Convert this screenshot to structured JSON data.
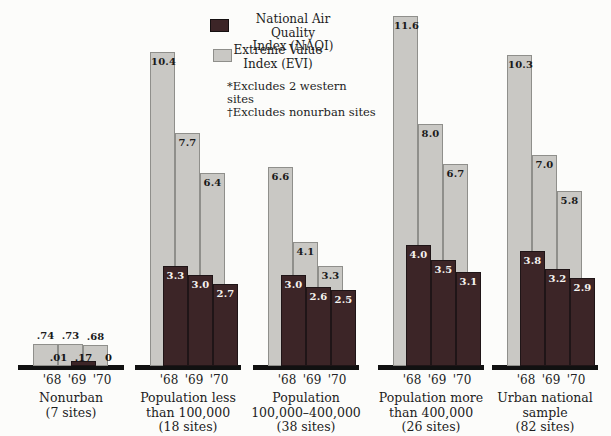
{
  "chart_data": {
    "type": "bar",
    "title": "",
    "years": [
      "'68",
      "'69",
      "'70"
    ],
    "legend": [
      {
        "line1": "National Air Quality",
        "line2": "Index (NAQI)",
        "color": "#3c2527"
      },
      {
        "line1": "Extreme Value",
        "line2": "Index (EVI)",
        "color": "#c9c8c4"
      }
    ],
    "notes": [
      "*Excludes 2 western sites",
      "†Excludes nonurban sites"
    ],
    "ylim": [
      0,
      11.6
    ],
    "grid": false,
    "legend_position": "top-left",
    "groups": [
      {
        "label_lines": [
          "Nonurban",
          "(7 sites)"
        ],
        "evi_values": [
          0.74,
          0.73,
          0.68
        ],
        "evi_labels": [
          ".74",
          ".73",
          ".68"
        ],
        "naqi_values": [
          0.01,
          0.17,
          0
        ],
        "naqi_labels": [
          ".01",
          ".17",
          "0"
        ]
      },
      {
        "label_lines": [
          "Population less",
          "than 100,000",
          "(18 sites)"
        ],
        "evi_values": [
          10.4,
          7.7,
          6.4
        ],
        "evi_labels": [
          "10.4",
          "7.7",
          "6.4"
        ],
        "naqi_values": [
          3.3,
          3.0,
          2.7
        ],
        "naqi_labels": [
          "3.3",
          "3.0",
          "2.7"
        ]
      },
      {
        "label_lines": [
          "Population",
          "100,000–400,000",
          "(38 sites)"
        ],
        "evi_values": [
          6.6,
          4.1,
          3.3
        ],
        "evi_labels": [
          "6.6",
          "4.1",
          "3.3"
        ],
        "naqi_values": [
          3.0,
          2.6,
          2.5
        ],
        "naqi_labels": [
          "3.0",
          "2.6",
          "2.5"
        ]
      },
      {
        "label_lines": [
          "Population more",
          "than 400,000",
          "(26 sites)"
        ],
        "evi_values": [
          11.6,
          8.0,
          6.7
        ],
        "evi_labels": [
          "11.6",
          "8.0",
          "6.7"
        ],
        "naqi_values": [
          4.0,
          3.5,
          3.1
        ],
        "naqi_labels": [
          "4.0",
          "3.5",
          "3.1"
        ]
      },
      {
        "label_lines": [
          "Urban national",
          "sample",
          "(82 sites)"
        ],
        "evi_values": [
          10.3,
          7.0,
          5.8
        ],
        "evi_labels": [
          "10.3",
          "7.0",
          "5.8"
        ],
        "naqi_values": [
          3.8,
          3.2,
          2.9
        ],
        "naqi_labels": [
          "3.8",
          "3.2",
          "2.9"
        ]
      }
    ]
  }
}
